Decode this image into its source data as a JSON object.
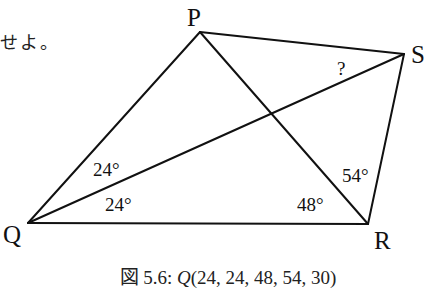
{
  "fragment_text": "せよ。",
  "figure": {
    "vertices": {
      "P": {
        "label": "P",
        "x": 200,
        "y": 32
      },
      "S": {
        "label": "S",
        "x": 404,
        "y": 54
      },
      "Q": {
        "label": "Q",
        "x": 28,
        "y": 223
      },
      "R": {
        "label": "R",
        "x": 368,
        "y": 224
      }
    },
    "segments": [
      "PQ",
      "PS",
      "PR",
      "QS",
      "QR",
      "RS"
    ],
    "angles": {
      "PQS": "24°",
      "SQR": "24°",
      "QRP": "48°",
      "PRS": "54°",
      "PSQ_unknown": "?"
    },
    "line_color": "#111111"
  },
  "caption": {
    "prefix": "図 5.6: ",
    "func": "Q",
    "args": "(24, 24, 48, 54, 30)"
  }
}
